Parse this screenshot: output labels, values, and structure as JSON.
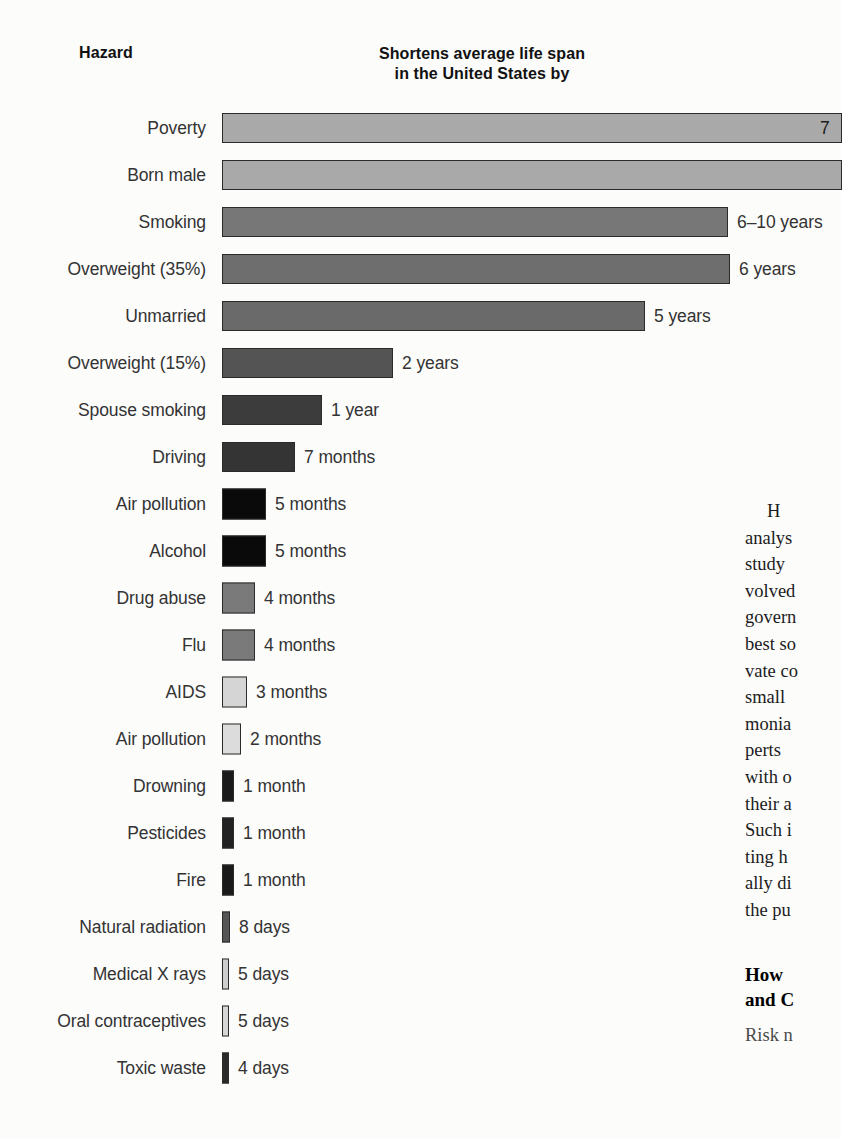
{
  "headers": {
    "hazard": "Hazard",
    "span_line1": "Shortens average life span",
    "span_line2": "in the United States by"
  },
  "chart_data": {
    "type": "bar",
    "orientation": "horizontal",
    "title": "Shortens average life span in the United States by",
    "xlabel": "",
    "ylabel": "Hazard",
    "categories": [
      "Poverty",
      "Born male",
      "Smoking",
      "Overweight (35%)",
      "Unmarried",
      "Overweight (15%)",
      "Spouse smoking",
      "Driving",
      "Air pollution",
      "Alcohol",
      "Drug abuse",
      "Flu",
      "AIDS",
      "Air pollution",
      "Drowning",
      "Pesticides",
      "Fire",
      "Natural radiation",
      "Medical X rays",
      "Oral contraceptives",
      "Toxic waste"
    ],
    "value_labels": [
      "7",
      "",
      "6–10 years",
      "6 years",
      "5 years",
      "2 years",
      "1 year",
      "7 months",
      "5 months",
      "5 months",
      "4 months",
      "4 months",
      "3 months",
      "2 months",
      "1 month",
      "1 month",
      "1 month",
      "8 days",
      "5 days",
      "5 days",
      "4 days",
      ""
    ],
    "values_days": [
      2920,
      2920,
      2920,
      2190,
      1825,
      730,
      365,
      213,
      152,
      152,
      122,
      122,
      91,
      61,
      30,
      30,
      30,
      8,
      5,
      5,
      4
    ],
    "units": [
      "years",
      "years",
      "years",
      "years",
      "years",
      "years",
      "year",
      "months",
      "months",
      "months",
      "months",
      "months",
      "months",
      "months",
      "month",
      "month",
      "month",
      "days",
      "days",
      "days",
      "days"
    ],
    "bar_px": [
      620,
      620,
      506,
      508,
      423,
      171,
      100,
      73,
      44,
      44,
      33,
      33,
      25,
      19,
      12,
      12,
      12,
      8,
      7,
      7,
      7
    ],
    "bar_colors": [
      "#a9a9a9",
      "#a9a9a9",
      "#777777",
      "#6e6e6e",
      "#6a6a6a",
      "#545454",
      "#3c3c3c",
      "#343434",
      "#0a0a0a",
      "#0a0a0a",
      "#7a7a7a",
      "#7a7a7a",
      "#d5d5d5",
      "#dcdcdc",
      "#1a1a1a",
      "#222222",
      "#1a1a1a",
      "#555555",
      "#cfcfcf",
      "#d6d6d6",
      "#2a2a2a"
    ],
    "value_inside": [
      true,
      false,
      false,
      false,
      false,
      false,
      false,
      false,
      false,
      false,
      false,
      false,
      false,
      false,
      false,
      false,
      false,
      false,
      false,
      false,
      false
    ],
    "grid": false,
    "legend": false
  },
  "article": {
    "paragraph_lines": [
      "H",
      "analys",
      "study",
      "volved",
      "govern",
      "best so",
      "vate co",
      "small",
      "monia",
      "perts",
      "with o",
      "their a",
      "Such i",
      "ting h",
      "ally di",
      "the pu"
    ],
    "section_heading_lines": [
      "How",
      "and C"
    ],
    "section_body_lines": [
      "Risk n"
    ]
  }
}
